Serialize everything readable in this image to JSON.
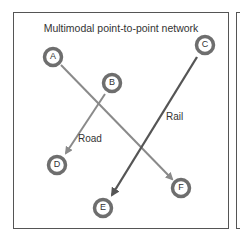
{
  "title": "Multimodal point-to-point network",
  "colors": {
    "road": "#8a8a8a",
    "rail": "#555555",
    "node_ring": "#6e6e6e",
    "border": "#555555"
  },
  "nodes": [
    {
      "id": "A",
      "x": 53,
      "y": 57
    },
    {
      "id": "B",
      "x": 112,
      "y": 83
    },
    {
      "id": "C",
      "x": 205,
      "y": 45
    },
    {
      "id": "D",
      "x": 57,
      "y": 165
    },
    {
      "id": "E",
      "x": 103,
      "y": 208
    },
    {
      "id": "F",
      "x": 181,
      "y": 188
    }
  ],
  "links": [
    {
      "from": "A",
      "to": "F",
      "mode": "road"
    },
    {
      "from": "B",
      "to": "D",
      "mode": "road"
    },
    {
      "from": "C",
      "to": "E",
      "mode": "rail"
    }
  ],
  "labels": {
    "road": "Road",
    "rail": "Rail"
  }
}
